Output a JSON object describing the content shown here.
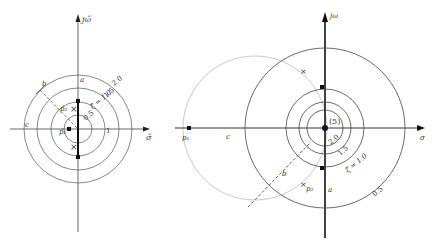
{
  "left_diagram": {
    "axes": {
      "x_label": "σ̂",
      "y_label": "jω̂"
    },
    "circles": [
      "0.5",
      "1",
      "1.5",
      "2.0"
    ],
    "zeta_label": "ζ̂ = 1.0",
    "points": {
      "p1": "p̂₁",
      "p2": "p̂₂"
    },
    "segment_labels": {
      "a": "a",
      "b": "b",
      "c": "c"
    }
  },
  "right_diagram": {
    "axes": {
      "x_label": "σ",
      "y_label": "jω"
    },
    "circles": [
      "2.0",
      "1.5",
      "ζ = 1.0",
      "0.5"
    ],
    "origin_label": "(5)",
    "points": {
      "p1": "p₁",
      "p2": "p₂"
    },
    "segment_labels": {
      "a": "a",
      "b": "b",
      "c": "c"
    }
  }
}
